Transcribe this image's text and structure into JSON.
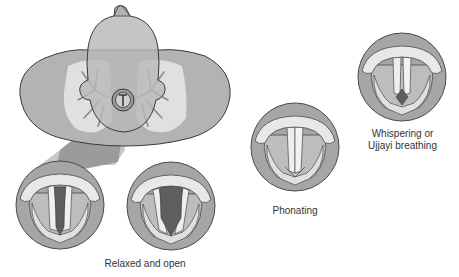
{
  "figure": {
    "colors": {
      "background": "#ffffff",
      "skin": "#b3b3b3",
      "skin_outline": "#3a3a3a",
      "lungs": "#e4e4e4",
      "bronchi": "#8a8a8a",
      "projection_beam": "#8c8c8c",
      "ring": "#a6a6a6",
      "ring_outline": "#4a4a4a",
      "fold_light": "#e9e9e9",
      "fold_mid": "#cfcfcf",
      "glottis_dark": "#5e5e5e",
      "text": "#333333"
    },
    "overview": {
      "name": "Top-down view of torso with head, lungs and larynx highlighted"
    },
    "states": [
      {
        "id": "relaxed-1",
        "group": "relaxed",
        "glottis": "narrow-open"
      },
      {
        "id": "relaxed-2",
        "group": "relaxed",
        "glottis": "wide-open"
      },
      {
        "id": "phonating",
        "group": "phonating",
        "glottis": "closed"
      },
      {
        "id": "whispering",
        "group": "whispering",
        "glottis": "small-posterior-gap"
      }
    ],
    "labels": {
      "relaxed": "Relaxed and open",
      "phonating": "Phonating",
      "whispering_line1": "Whispering or",
      "whispering_line2": "Ujjayi breathing"
    }
  }
}
